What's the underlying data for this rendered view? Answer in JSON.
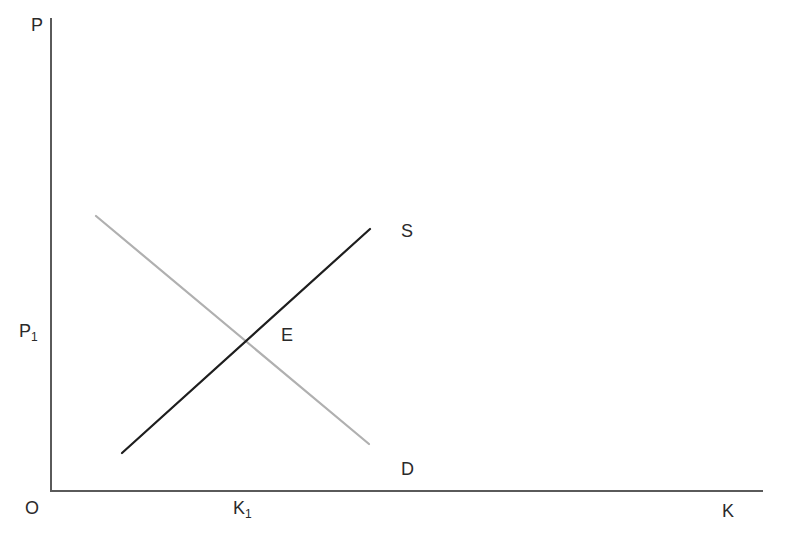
{
  "diagram": {
    "type": "supply-demand",
    "axes": {
      "y_label": "P",
      "x_label": "K",
      "origin_label": "O"
    },
    "equilibrium": {
      "label": "E",
      "price_label_main": "P",
      "price_label_sub": "1",
      "quantity_label_main": "K",
      "quantity_label_sub": "1"
    },
    "curves": [
      {
        "name": "S",
        "label": "S",
        "kind": "supply",
        "slope": "upward",
        "color": "#1e1e1e"
      },
      {
        "name": "D",
        "label": "D",
        "kind": "demand",
        "slope": "downward",
        "color": "#b0b0b0"
      }
    ],
    "axis_color": "#5a5a5a"
  }
}
